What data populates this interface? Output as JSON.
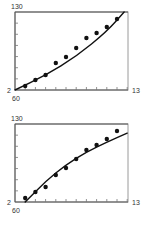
{
  "chart_data": [
    {
      "type": "scatter",
      "title": "",
      "xlabel": "",
      "ylabel": "",
      "y_tick_labels": [
        "2",
        "130"
      ],
      "x_tick_labels": [
        "60",
        "13"
      ],
      "ylim": [
        2,
        130
      ],
      "grid": false,
      "legend": null,
      "fit": "convex curve",
      "x": [
        1,
        2,
        3,
        4,
        5,
        6,
        7,
        8,
        9,
        10
      ],
      "values": [
        8.6,
        18.4,
        26.6,
        46.3,
        56.2,
        70.9,
        87.3,
        95.5,
        105.4,
        118.5
      ],
      "fit_line": {
        "x": [
          0,
          3,
          6,
          9,
          10.7
        ],
        "y": [
          2,
          26,
          57,
          98,
          130
        ]
      }
    },
    {
      "type": "scatter",
      "title": "",
      "xlabel": "",
      "ylabel": "",
      "y_tick_labels": [
        "2",
        "130"
      ],
      "x_tick_labels": [
        "60",
        "13"
      ],
      "ylim": [
        2,
        130
      ],
      "grid": false,
      "legend": null,
      "fit": "concave curve",
      "x": [
        1,
        2,
        3,
        4,
        5,
        6,
        7,
        8,
        9,
        10
      ],
      "values": [
        8.6,
        18.4,
        26.6,
        46.3,
        57.8,
        72.6,
        87.3,
        95.5,
        105.4,
        118.5
      ],
      "fit_line": {
        "x": [
          1,
          3,
          5,
          7,
          9,
          11
        ],
        "y": [
          2,
          36,
          63,
          84,
          100,
          115
        ]
      }
    }
  ],
  "charts": [
    {
      "ymax": "130",
      "ymin": "2",
      "xmin": "60",
      "xmax": "13"
    },
    {
      "ymax": "130",
      "ymin": "2",
      "xmin": "60",
      "xmax": "13"
    }
  ]
}
